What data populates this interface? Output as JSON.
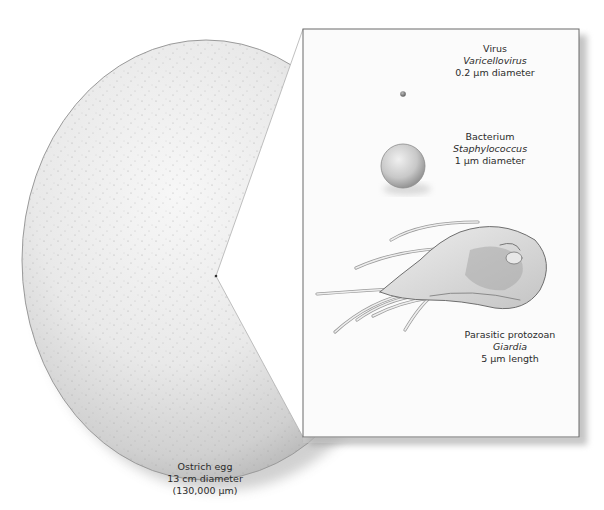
{
  "figure": {
    "type": "scale comparison illustration",
    "egg": {
      "name": "Ostrich egg",
      "size": "13 cm diameter",
      "size_um": "(130,000 µm)"
    },
    "inset": {
      "items": [
        {
          "category": "Virus",
          "genus": "Varicellovirus",
          "size": "0.2 µm diameter"
        },
        {
          "category": "Bacterium",
          "genus": "Staphylococcus",
          "size": "1 µm diameter"
        },
        {
          "category": "Parasitic protozoan",
          "genus": "Giardia",
          "size": "5 µm length"
        }
      ]
    },
    "colors": {
      "background": "#ffffff",
      "egg_light": "#f2f2f2",
      "egg_shadow": "#b8b8b8",
      "panel": "#fbfbfb",
      "panel_border": "#6a6a6a",
      "text": "#2b2b2b"
    }
  }
}
